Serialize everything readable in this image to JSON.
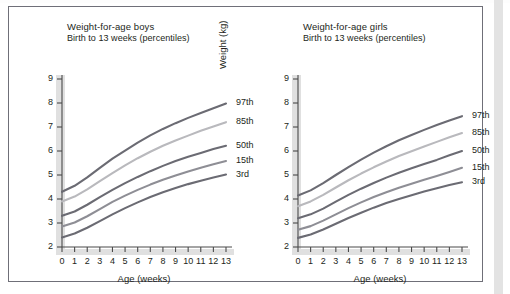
{
  "figure": {
    "panels": [
      {
        "id": "boys",
        "title": "Weight-for-age boys",
        "subtitle": "Birth to 13 weeks (percentiles)",
        "y_axis_title": "Weight (kg)",
        "x_axis_title": "Age (weeks)"
      },
      {
        "id": "girls",
        "title": "Weight-for-age girls",
        "subtitle": "Birth to 13 weeks (percentiles)",
        "y_axis_title": "Weight (kg)",
        "x_axis_title": "Age (weeks)"
      }
    ],
    "y_ticks": [
      "2",
      "3",
      "4",
      "5",
      "6",
      "7",
      "8",
      "9"
    ],
    "x_ticks": [
      "0",
      "1",
      "2",
      "3",
      "4",
      "5",
      "6",
      "7",
      "8",
      "9",
      "10",
      "11",
      "12",
      "13"
    ],
    "series_labels": [
      "97th",
      "85th",
      "50th",
      "15th",
      "3rd"
    ],
    "colors": {
      "frame": "#6f6f78",
      "axis": "#4a4a4a",
      "axis_shadow": "#e0e0e0",
      "text": "#231f20",
      "p97": "#6b6b73",
      "p85": "#b9b9bd",
      "p50": "#6b6b73",
      "p15": "#8e8e95",
      "p3": "#6b6b73",
      "scan_band": "#e3e3e3"
    }
  },
  "chart_data": [
    {
      "type": "line",
      "title": "Weight-for-age boys",
      "subtitle": "Birth to 13 weeks (percentiles)",
      "xlabel": "Age (weeks)",
      "ylabel": "Weight (kg)",
      "xlim": [
        0,
        13
      ],
      "ylim": [
        2,
        9
      ],
      "xticks": [
        0,
        1,
        2,
        3,
        4,
        5,
        6,
        7,
        8,
        9,
        10,
        11,
        12,
        13
      ],
      "yticks": [
        2,
        3,
        4,
        5,
        6,
        7,
        8,
        9
      ],
      "grid": false,
      "legend_position": "right-inline-labels",
      "x": [
        0,
        1,
        2,
        3,
        4,
        5,
        6,
        7,
        8,
        9,
        10,
        11,
        12,
        13
      ],
      "series": [
        {
          "name": "97th",
          "color": "#6b6b73",
          "values": [
            4.3,
            4.55,
            4.9,
            5.3,
            5.68,
            6.02,
            6.35,
            6.65,
            6.92,
            7.16,
            7.38,
            7.58,
            7.78,
            7.98
          ]
        },
        {
          "name": "85th",
          "color": "#b9b9bd",
          "values": [
            3.9,
            4.1,
            4.4,
            4.74,
            5.08,
            5.4,
            5.7,
            5.97,
            6.22,
            6.44,
            6.64,
            6.84,
            7.02,
            7.2
          ]
        },
        {
          "name": "50th",
          "color": "#6b6b73",
          "values": [
            3.3,
            3.48,
            3.76,
            4.08,
            4.38,
            4.66,
            4.92,
            5.16,
            5.38,
            5.58,
            5.76,
            5.92,
            6.08,
            6.22
          ]
        },
        {
          "name": "15th",
          "color": "#8e8e95",
          "values": [
            2.85,
            3.02,
            3.28,
            3.58,
            3.88,
            4.14,
            4.38,
            4.6,
            4.8,
            4.98,
            5.15,
            5.3,
            5.45,
            5.58
          ]
        },
        {
          "name": "3rd",
          "color": "#6b6b73",
          "values": [
            2.4,
            2.56,
            2.8,
            3.08,
            3.36,
            3.62,
            3.86,
            4.08,
            4.28,
            4.46,
            4.62,
            4.76,
            4.9,
            5.02
          ]
        }
      ]
    },
    {
      "type": "line",
      "title": "Weight-for-age girls",
      "subtitle": "Birth to 13 weeks (percentiles)",
      "xlabel": "Age (weeks)",
      "ylabel": "Weight (kg)",
      "xlim": [
        0,
        13
      ],
      "ylim": [
        2,
        9
      ],
      "xticks": [
        0,
        1,
        2,
        3,
        4,
        5,
        6,
        7,
        8,
        9,
        10,
        11,
        12,
        13
      ],
      "yticks": [
        2,
        3,
        4,
        5,
        6,
        7,
        8,
        9
      ],
      "grid": false,
      "legend_position": "right-inline-labels",
      "x": [
        0,
        1,
        2,
        3,
        4,
        5,
        6,
        7,
        8,
        9,
        10,
        11,
        12,
        13
      ],
      "series": [
        {
          "name": "97th",
          "color": "#6b6b73",
          "values": [
            4.15,
            4.36,
            4.66,
            5.0,
            5.33,
            5.64,
            5.93,
            6.2,
            6.45,
            6.67,
            6.88,
            7.08,
            7.27,
            7.45
          ]
        },
        {
          "name": "85th",
          "color": "#b9b9bd",
          "values": [
            3.7,
            3.9,
            4.17,
            4.48,
            4.78,
            5.06,
            5.32,
            5.56,
            5.79,
            5.99,
            6.19,
            6.38,
            6.57,
            6.75
          ]
        },
        {
          "name": "50th",
          "color": "#6b6b73",
          "values": [
            3.2,
            3.36,
            3.6,
            3.89,
            4.17,
            4.43,
            4.67,
            4.89,
            5.09,
            5.28,
            5.46,
            5.63,
            5.82,
            6.0
          ]
        },
        {
          "name": "15th",
          "color": "#8e8e95",
          "values": [
            2.72,
            2.87,
            3.1,
            3.36,
            3.62,
            3.86,
            4.08,
            4.28,
            4.47,
            4.64,
            4.8,
            4.96,
            5.13,
            5.3
          ]
        },
        {
          "name": "3rd",
          "color": "#6b6b73",
          "values": [
            2.38,
            2.52,
            2.73,
            2.97,
            3.21,
            3.43,
            3.64,
            3.83,
            4.0,
            4.16,
            4.31,
            4.45,
            4.58,
            4.7
          ]
        }
      ]
    }
  ]
}
